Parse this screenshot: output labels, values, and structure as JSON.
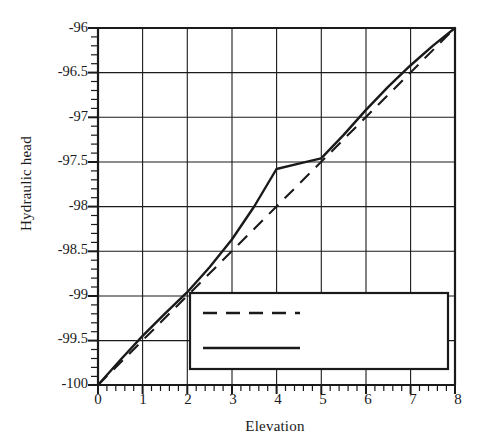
{
  "chart_data": {
    "type": "line",
    "title": "",
    "subtitle": "",
    "xlabel": "Elevation",
    "ylabel": "Hydraulic head",
    "xlim": [
      0,
      8
    ],
    "ylim": [
      -100,
      -96
    ],
    "grid": true,
    "grid_x_major_step": 1,
    "grid_y_major_step": 0.5,
    "minor_ticks_x_per_major": 5,
    "minor_ticks_y_per_major": 5,
    "legend_position": "lower-right-inside",
    "xticks": [
      "0",
      "1",
      "2",
      "3",
      "4",
      "5",
      "6",
      "7",
      "8"
    ],
    "xtick_values": [
      0,
      1,
      2,
      3,
      4,
      5,
      6,
      7,
      8
    ],
    "yticks": [
      "-96",
      "-96.5",
      "-97",
      "-97.5",
      "-98",
      "-98.5",
      "-99",
      "-99.5",
      "-100"
    ],
    "ytick_values": [
      -96,
      -96.5,
      -97,
      -97.5,
      -98,
      -98.5,
      -99,
      -99.5,
      -100
    ],
    "series": [
      {
        "name": "Homogeneous",
        "style": "dashed",
        "color": "#1a1a1a",
        "x": [
          0,
          1,
          2,
          3,
          4,
          5,
          6,
          7,
          8
        ],
        "values": [
          -100,
          -99.5,
          -99.0,
          -98.5,
          -98.0,
          -97.5,
          -97.0,
          -96.5,
          -96.0
        ]
      },
      {
        "name": "Structured",
        "style": "solid",
        "color": "#1a1a1a",
        "x": [
          0,
          0.5,
          1,
          1.5,
          2,
          2.5,
          3,
          3.5,
          4,
          4.5,
          5,
          5.5,
          6,
          6.5,
          7,
          7.5,
          8
        ],
        "values": [
          -100,
          -99.72,
          -99.45,
          -99.2,
          -98.96,
          -98.68,
          -98.37,
          -98.0,
          -97.58,
          -97.52,
          -97.46,
          -97.2,
          -96.92,
          -96.66,
          -96.42,
          -96.2,
          -96.0
        ]
      }
    ],
    "annotations": []
  },
  "legend": {
    "items": [
      {
        "label": "Homogeneous",
        "style": "dashed"
      },
      {
        "label": "Structured",
        "style": "solid"
      }
    ]
  },
  "axes": {
    "x_label": "Elevation",
    "y_label": "Hydraulic head"
  }
}
